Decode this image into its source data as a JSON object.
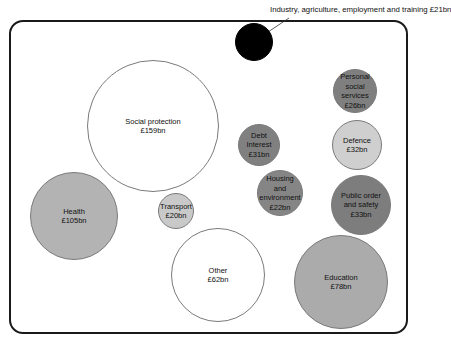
{
  "chart_data": {
    "type": "bubble",
    "title": "",
    "unit": "£bn",
    "legend": "none",
    "grid": false,
    "series": [
      {
        "name": "Social protection",
        "value": 159,
        "label": "Social protection\n£159bn",
        "cx": 153,
        "cy": 126,
        "r": 66,
        "fill": "#ffffff"
      },
      {
        "name": "Health",
        "value": 105,
        "label": "Health\n£105bn",
        "cx": 74,
        "cy": 216,
        "r": 44,
        "fill": "#b3b3b3"
      },
      {
        "name": "Education",
        "value": 78,
        "label": "Education\n£78bn",
        "cx": 341,
        "cy": 282,
        "r": 47,
        "fill": "#ababab"
      },
      {
        "name": "Other",
        "value": 62,
        "label": "Other\n£62bn",
        "cx": 218,
        "cy": 275,
        "r": 47,
        "fill": "#ffffff"
      },
      {
        "name": "Public order and safety",
        "value": 33,
        "label": "Public order\nand safety\n£33bn",
        "cx": 361,
        "cy": 205,
        "r": 30,
        "fill": "#7d7d7d"
      },
      {
        "name": "Defence",
        "value": 32,
        "label": "Defence\n£32bn",
        "cx": 357,
        "cy": 145,
        "r": 25,
        "fill": "#cfcfcf"
      },
      {
        "name": "Debt Interest",
        "value": 31,
        "label": "Debt\nInterest\n£31bn",
        "cx": 259,
        "cy": 145,
        "r": 21,
        "fill": "#808080"
      },
      {
        "name": "Personal social services",
        "value": 26,
        "label": "Personal\nsocial\nservices\n£26bn",
        "cx": 355,
        "cy": 91,
        "r": 22,
        "fill": "#7f7f7f"
      },
      {
        "name": "Housing and environment",
        "value": 22,
        "label": "Housing\nand\nenvironment\n£22bn",
        "cx": 280,
        "cy": 193,
        "r": 23,
        "fill": "#858585"
      },
      {
        "name": "Industry, agriculture, employment and training",
        "value": 21,
        "label": "",
        "cx": 254,
        "cy": 42,
        "r": 19,
        "fill": "#000000"
      },
      {
        "name": "Transport",
        "value": 20,
        "label": "Transport\n£20bn",
        "cx": 176,
        "cy": 211,
        "r": 18,
        "fill": "#c9c9c9"
      }
    ],
    "annotations": [
      {
        "text": "Industry, agriculture, employment and training £21bn",
        "x": 270,
        "y": 5,
        "line_from": [
          289,
          18
        ],
        "line_to": [
          268,
          32
        ]
      }
    ]
  }
}
